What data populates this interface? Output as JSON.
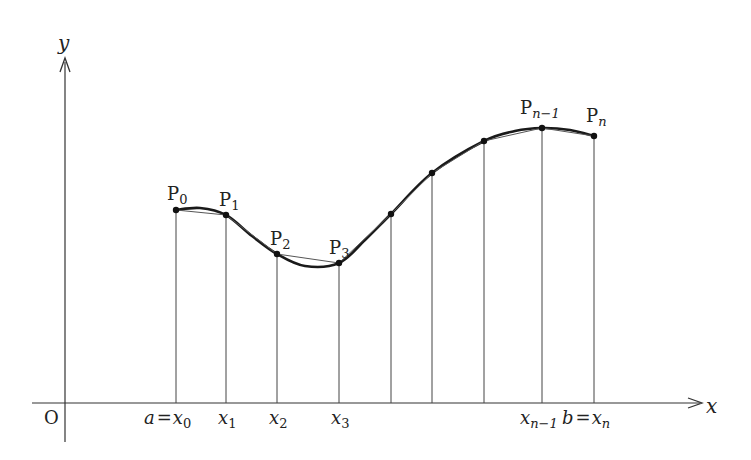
{
  "diagram": {
    "type": "polygonal-approximation-of-curve",
    "axes": {
      "x_label": "x",
      "y_label": "y",
      "origin_label": "O"
    },
    "curve_points": [
      {
        "label_main": "P",
        "label_sub": "0",
        "x": 176,
        "y": 210
      },
      {
        "label_main": "P",
        "label_sub": "1",
        "x": 226,
        "y": 215
      },
      {
        "label_main": "P",
        "label_sub": "2",
        "x": 277,
        "y": 254
      },
      {
        "label_main": "P",
        "label_sub": "3",
        "x": 339,
        "y": 263
      },
      {
        "label_main": "",
        "label_sub": "",
        "x": 391,
        "y": 214
      },
      {
        "label_main": "",
        "label_sub": "",
        "x": 432,
        "y": 173
      },
      {
        "label_main": "",
        "label_sub": "",
        "x": 484,
        "y": 141
      },
      {
        "label_main": "P",
        "label_sub": "n−1",
        "x": 542,
        "y": 128
      },
      {
        "label_main": "P",
        "label_sub": "n",
        "x": 594,
        "y": 136
      }
    ],
    "x_tick_labels": [
      {
        "prefix": "a",
        "eq": "=",
        "main": "x",
        "sub": "0",
        "x": 176
      },
      {
        "prefix": "",
        "eq": "",
        "main": "x",
        "sub": "1",
        "x": 226
      },
      {
        "prefix": "",
        "eq": "",
        "main": "x",
        "sub": "2",
        "x": 277
      },
      {
        "prefix": "",
        "eq": "",
        "main": "x",
        "sub": "3",
        "x": 339
      },
      {
        "prefix": "",
        "eq": "",
        "main": "x",
        "sub": "n−1",
        "x": 542
      },
      {
        "prefix": "b",
        "eq": "=",
        "main": "x",
        "sub": "n",
        "x": 594
      }
    ]
  }
}
